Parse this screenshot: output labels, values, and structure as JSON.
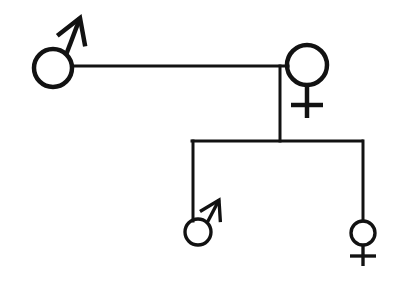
{
  "diagram": {
    "type": "family-pedigree",
    "background_color": "#ffffff",
    "stroke_color": "#121212",
    "canvas": {
      "width": 397,
      "height": 283
    }
  },
  "symbols": {
    "male": {
      "name": "mars-symbol",
      "label": "Male",
      "glyph": "♂",
      "description": "circle with arrow pointing up-right"
    },
    "female": {
      "name": "venus-symbol",
      "label": "Female",
      "glyph": "♀",
      "description": "circle with cross below"
    }
  },
  "nodes": [
    {
      "id": "father",
      "data_name": "node-father",
      "sex": "male",
      "generation": 1,
      "label": "Father",
      "cx": 53,
      "cy": 68,
      "r": 19,
      "stroke_width": 4,
      "arrow": {
        "from_x": 66,
        "from_y": 55,
        "to_x": 80,
        "to_y": 18,
        "head_size": 13
      }
    },
    {
      "id": "mother",
      "data_name": "node-mother",
      "sex": "female",
      "generation": 1,
      "label": "Mother",
      "cx": 307,
      "cy": 65,
      "r": 20,
      "stroke_width": 4,
      "cross": {
        "stem_x": 307,
        "stem_top": 85,
        "stem_bottom": 118,
        "bar_y": 105,
        "bar_left": 291,
        "bar_right": 323
      }
    },
    {
      "id": "son",
      "data_name": "node-son",
      "sex": "male",
      "generation": 2,
      "label": "Son",
      "cx": 198,
      "cy": 232,
      "r": 13,
      "stroke_width": 3,
      "arrow": {
        "from_x": 207,
        "from_y": 223,
        "to_x": 219,
        "to_y": 200,
        "head_size": 10
      }
    },
    {
      "id": "daughter",
      "data_name": "node-daughter",
      "sex": "female",
      "generation": 2,
      "label": "Daughter",
      "cx": 363,
      "cy": 233,
      "r": 12,
      "stroke_width": 3,
      "cross": {
        "stem_x": 363,
        "stem_top": 245,
        "stem_bottom": 266,
        "bar_y": 256,
        "bar_left": 350,
        "bar_right": 376
      }
    }
  ],
  "connectors": [
    {
      "id": "marriage-line",
      "data_name": "marriage-line",
      "label": "Marriage line",
      "x1": 72,
      "y1": 66,
      "x2": 288,
      "y2": 66,
      "stroke_width": 3
    },
    {
      "id": "descent-line",
      "data_name": "descent-line",
      "label": "Descent line",
      "x1": 280,
      "y1": 66,
      "x2": 280,
      "y2": 141,
      "stroke_width": 3
    },
    {
      "id": "sibling-bar",
      "data_name": "sibling-bar",
      "label": "Sibship line",
      "x1": 192,
      "y1": 141,
      "x2": 362,
      "y2": 141,
      "stroke_width": 3
    },
    {
      "id": "son-stem",
      "data_name": "son-stem-line",
      "label": "Son stem",
      "x1": 193,
      "y1": 141,
      "x2": 193,
      "y2": 221,
      "stroke_width": 3
    },
    {
      "id": "daughter-stem",
      "data_name": "daughter-stem-line",
      "label": "Daughter stem",
      "x1": 363,
      "y1": 141,
      "x2": 363,
      "y2": 221,
      "stroke_width": 3
    }
  ]
}
